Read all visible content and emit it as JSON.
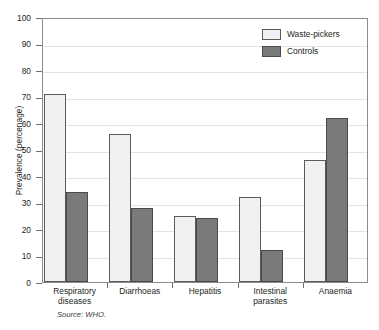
{
  "figure": {
    "y_axis_title": "Prevalence (percenage)",
    "source_note": "Source: WHO.",
    "title_fragment": ""
  },
  "legend": {
    "position": "top-right",
    "entries": [
      {
        "label": "Waste-pickers",
        "swatch": "light-swatch-icon",
        "color": "#f1f1f1"
      },
      {
        "label": "Controls",
        "swatch": "dark-swatch-icon",
        "color": "#7a7a7a"
      }
    ]
  },
  "axis": {
    "y_ticks": [
      "100",
      "90",
      "80",
      "70",
      "60",
      "50",
      "40",
      "30",
      "20",
      "10",
      "0"
    ]
  },
  "chart_data": {
    "type": "bar",
    "title": "",
    "xlabel": "",
    "ylabel": "Prevalence (percenage)",
    "ylim": [
      0,
      100
    ],
    "ytick_step": 10,
    "grid": true,
    "legend_position": "top-right",
    "categories": [
      "Respiratory diseases",
      "Diarrhoeas",
      "Hepatitis",
      "Intestinal parasites",
      "Anaemia"
    ],
    "series": [
      {
        "name": "Waste-pickers",
        "color": "#f1f1f1",
        "values": [
          71,
          56,
          25,
          32,
          46
        ]
      },
      {
        "name": "Controls",
        "color": "#7a7a7a",
        "values": [
          34,
          28,
          24,
          12,
          62
        ]
      }
    ],
    "source": "WHO."
  }
}
